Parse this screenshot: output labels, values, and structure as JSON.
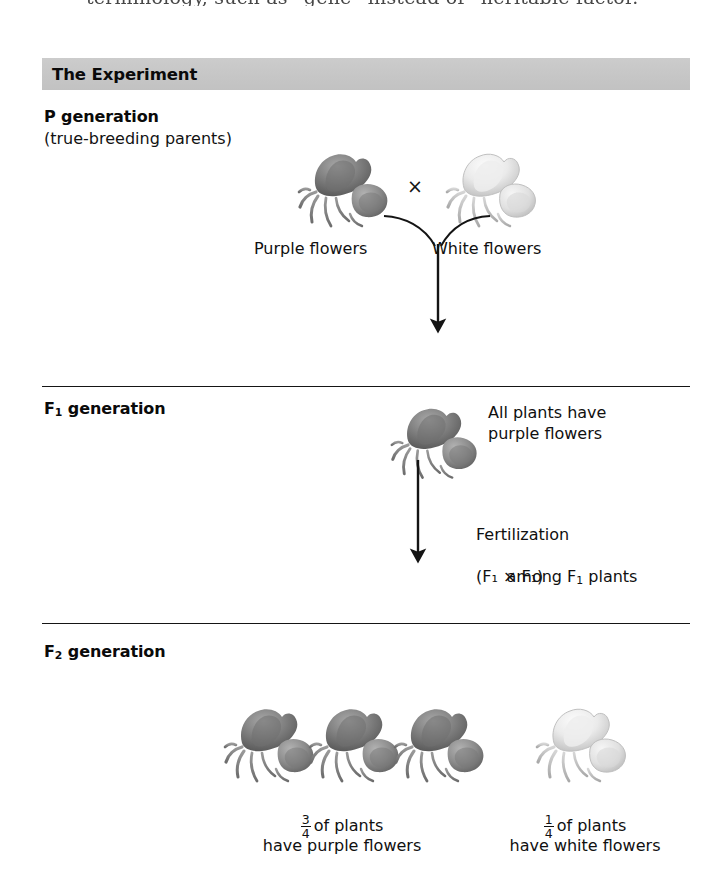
{
  "page": {
    "cropped_running_text": "terminology, such as “gene” instead of “heritable factor.”",
    "width": 718,
    "height": 887,
    "background_color": "#ffffff"
  },
  "figure": {
    "header": {
      "label": "The Experiment",
      "band_color": "#c9c9c9"
    },
    "sections": [
      {
        "id": "p-generation",
        "label": "P generation",
        "sublabel": "(true-breeding parents)",
        "parents": [
          {
            "name": "purple-parent",
            "caption": "Purple flowers",
            "color": "purple"
          },
          {
            "name": "white-parent",
            "caption": "White flowers",
            "color": "white"
          }
        ],
        "cross_symbol": "×"
      },
      {
        "id": "f1-generation",
        "label_prefix": "F",
        "label_subscript": "1",
        "label_suffix": " generation",
        "offspring_caption_line1": "All plants have",
        "offspring_caption_line2": "purple flowers",
        "flower_color": "purple",
        "fertilization_note": {
          "line1": "Fertilization",
          "line2_pre": "among F",
          "line2_sub": "1",
          "line2_post": " plants",
          "line3": "(F₁ × F₁)"
        }
      },
      {
        "id": "f2-generation",
        "label_prefix": "F",
        "label_subscript": "2",
        "label_suffix": " generation",
        "results": [
          {
            "name": "purple-result",
            "fraction_numerator": "3",
            "fraction_denominator": "4",
            "text_line1_after_fraction": "of plants",
            "text_line2": "have purple flowers",
            "count": 3,
            "color": "purple"
          },
          {
            "name": "white-result",
            "fraction_numerator": "1",
            "fraction_denominator": "4",
            "text_line1_after_fraction": "of plants",
            "text_line2": "have white flowers",
            "count": 1,
            "color": "white"
          }
        ]
      }
    ],
    "colors": {
      "rule": "#151515",
      "text": "#101010",
      "header_band": "#c9c9c9",
      "purple_flower_dark": "#6f6f6f",
      "purple_flower_light": "#9e9e9e",
      "white_flower_dark": "#c9c9c9",
      "white_flower_light": "#f2f2f2"
    }
  }
}
